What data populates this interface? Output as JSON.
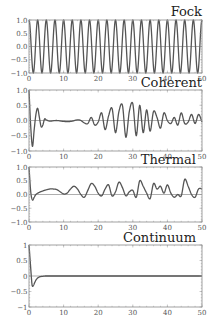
{
  "chart_data": [
    {
      "type": "line",
      "title": "Fock",
      "xlabel": "",
      "ylabel": "",
      "xlim": [
        0,
        50
      ],
      "ylim": [
        -1.0,
        1.0
      ],
      "xticks": [
        "0",
        "10",
        "20",
        "30",
        "40",
        "50"
      ],
      "yticks": [
        "1.0",
        "0.5",
        "0.0",
        "−0.5",
        "−1.0"
      ],
      "grid": false,
      "description": "Pure cosine oscillation, amplitude 1, period ~2.5 (about 20 cycles over 0-50), starting at 1",
      "series": [
        {
          "name": "Fock",
          "model": "cos",
          "amplitude": 1.0,
          "period": 2.5
        }
      ]
    },
    {
      "type": "line",
      "title": "Coherent",
      "xlabel": "",
      "ylabel": "",
      "xlim": [
        0,
        50
      ],
      "ylim": [
        -1.0,
        1.0
      ],
      "xticks": [
        "0",
        "10",
        "20",
        "30",
        "40",
        "50"
      ],
      "yticks": [
        "1.0",
        "0.5",
        "0.0",
        "−0.5",
        "−1.0"
      ],
      "grid": false,
      "description": "Collapse at t~3, quiet ~5-16, revival growing 18-31 (peak ~0.55), decaying irregular oscillations 32-50",
      "series": [
        {
          "name": "Coherent",
          "x": [
            0,
            0.5,
            1.0,
            1.5,
            2.0,
            2.5,
            3.0,
            3.5,
            4.0,
            4.5,
            5.0,
            6,
            8,
            10,
            12,
            14,
            15,
            16,
            17,
            18,
            19,
            20,
            21,
            22,
            23,
            24,
            25,
            26,
            27,
            28,
            29,
            30,
            31,
            32,
            33,
            34,
            35,
            36,
            37,
            38,
            39,
            40,
            41,
            42,
            43,
            44,
            45,
            46,
            47,
            48,
            49,
            50
          ],
          "y": [
            1.0,
            -0.2,
            -0.85,
            -0.3,
            0.2,
            0.4,
            0.1,
            -0.2,
            -0.15,
            0.05,
            0.02,
            -0.02,
            0.0,
            -0.03,
            -0.03,
            0.02,
            0.0,
            -0.08,
            -0.1,
            0.1,
            -0.15,
            -0.05,
            0.25,
            -0.3,
            0.15,
            0.4,
            -0.4,
            0.3,
            0.5,
            -0.55,
            0.3,
            0.55,
            -0.5,
            0.5,
            -0.4,
            0.35,
            -0.35,
            0.3,
            0.1,
            -0.25,
            0.25,
            0.0,
            -0.1,
            0.1,
            -0.15,
            0.25,
            -0.1,
            -0.05,
            0.2,
            -0.1,
            0.2,
            -0.05
          ]
        }
      ]
    },
    {
      "type": "line",
      "title": "Thermal",
      "xlabel": "",
      "ylabel": "",
      "xlim": [
        0,
        50
      ],
      "ylim": [
        -1.0,
        1.0
      ],
      "xticks": [
        "0",
        "10",
        "20",
        "30",
        "40",
        "50"
      ],
      "yticks": [
        "1.0",
        "0.5",
        "0.0",
        "−0.5",
        "−1.0"
      ],
      "grid": false,
      "description": "Fast drop to -0.2, slow hump ~0.2 at t~6, then irregular noisy oscillations around 0.1-0.2",
      "series": [
        {
          "name": "Thermal",
          "x": [
            0,
            0.5,
            1,
            1.5,
            2,
            3,
            4,
            5,
            6,
            7,
            8,
            9,
            10,
            11,
            12,
            13,
            14,
            15,
            16,
            17,
            18,
            19,
            20,
            21,
            22,
            23,
            24,
            25,
            26,
            27,
            28,
            29,
            30,
            31,
            32,
            33,
            34,
            35,
            36,
            37,
            38,
            39,
            40,
            41,
            42,
            43,
            44,
            45,
            46,
            47,
            48,
            49,
            50
          ],
          "y": [
            1.0,
            0.1,
            -0.2,
            -0.1,
            0.0,
            0.08,
            0.13,
            0.17,
            0.2,
            0.2,
            0.18,
            0.1,
            0.02,
            0.05,
            0.2,
            0.3,
            0.2,
            0.0,
            -0.1,
            0.15,
            0.4,
            0.3,
            0.05,
            -0.05,
            0.2,
            0.35,
            -0.05,
            0.1,
            0.45,
            0.25,
            -0.05,
            0.1,
            0.15,
            -0.1,
            0.5,
            0.3,
            0.05,
            -0.15,
            0.4,
            0.2,
            0.3,
            0.05,
            0.35,
            0.05,
            -0.1,
            0.0,
            -0.05,
            0.55,
            0.3,
            0.0,
            -0.1,
            0.2,
            0.2
          ]
        }
      ]
    },
    {
      "type": "line",
      "title": "Continuum",
      "xlabel": "",
      "ylabel": "",
      "xlim": [
        0,
        50
      ],
      "ylim": [
        -1,
        1
      ],
      "xticks": [
        "0",
        "10",
        "20",
        "30",
        "40",
        "50"
      ],
      "yticks": [
        "1",
        "0.5",
        "0",
        "−0.5",
        "−1"
      ],
      "grid": false,
      "description": "Rapid decay from 1 to about -0.35 at t~1, then relaxes to 0 by t~4 and stays flat",
      "series": [
        {
          "name": "Continuum",
          "x": [
            0,
            0.4,
            0.8,
            1.0,
            1.3,
            1.7,
            2.2,
            3,
            4,
            5,
            10,
            20,
            30,
            40,
            50
          ],
          "y": [
            1.0,
            0.4,
            -0.2,
            -0.33,
            -0.3,
            -0.2,
            -0.1,
            -0.03,
            -0.01,
            0.0,
            0.0,
            0.0,
            0.0,
            0.0,
            0.0
          ]
        }
      ]
    }
  ],
  "panels": [
    {
      "title": "Fock"
    },
    {
      "title": "Coherent"
    },
    {
      "title": "Thermal"
    },
    {
      "title": "Continuum"
    }
  ]
}
